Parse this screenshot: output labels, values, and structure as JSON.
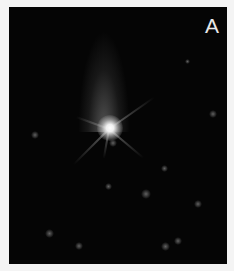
{
  "panel": {
    "label": "A",
    "description": "Fluorescence micrograph of a single bright cell body with radiating processes and a diffuse upward plume on dark background"
  },
  "colors": {
    "background": "#050505",
    "label": "#e8e8e8",
    "page": "#f4f4f4"
  }
}
